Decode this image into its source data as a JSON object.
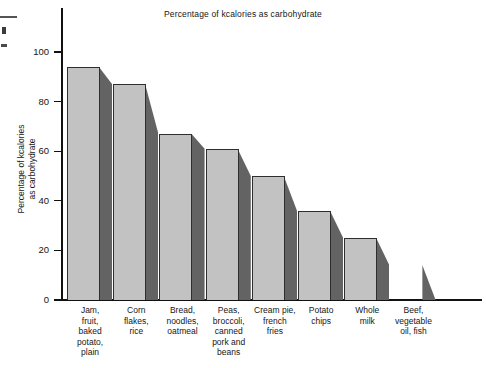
{
  "chart_data": {
    "type": "bar",
    "title": "Percentage of kcalories as carbohydrate",
    "xlabel": "",
    "ylabel": "Percentage of kcalories\nas carbohydrate",
    "ylabel_line1": "Percentage of kcalories",
    "ylabel_line2": "as carbohydrate",
    "ylim": [
      0,
      105
    ],
    "yticks": [
      0,
      20,
      40,
      60,
      80,
      100
    ],
    "ytick_labels": [
      "0",
      "20",
      "40",
      "60",
      "80",
      "100"
    ],
    "grid": false,
    "legend": "none",
    "style": "3d-shaded-bars",
    "colors": {
      "bar_front": "#c2c2c2",
      "bar_side": "#636363",
      "outline": "#2e2e2e",
      "axis": "#111111",
      "background": "#ffffff",
      "text": "#161616"
    },
    "categories": [
      "Jam, fruit, baked potato, plain",
      "Corn flakes, rice",
      "Bread, noodles, oatmeal",
      "Peas, broccoli, canned pork and beans",
      "Cream pie, french fries",
      "Potato chips",
      "Whole milk",
      "Beef, vegetable oil, fish"
    ],
    "category_label_lines": [
      [
        "Jam,",
        "fruit,",
        "baked",
        "potato,",
        "plain"
      ],
      [
        "Corn",
        "flakes,",
        "rice"
      ],
      [
        "Bread,",
        "noodles,",
        "oatmeal"
      ],
      [
        "Peas,",
        "broccoli,",
        "canned",
        "pork and",
        "beans"
      ],
      [
        "Cream pie,",
        "french",
        "fries"
      ],
      [
        "Potato",
        "chips"
      ],
      [
        "Whole",
        "milk"
      ],
      [
        "Beef,",
        "vegetable",
        "oil, fish"
      ]
    ],
    "values": [
      94,
      87,
      67,
      61,
      50,
      36,
      25,
      14
    ]
  }
}
